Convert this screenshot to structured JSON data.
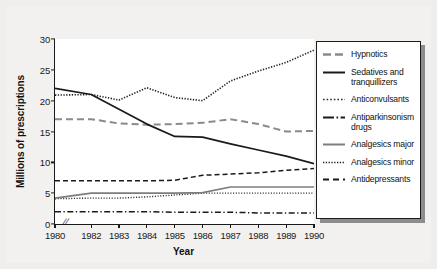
{
  "chart_data": {
    "type": "line",
    "title": "",
    "xlabel": "Year",
    "ylabel": "Millions of prescriptions",
    "x": [
      1980,
      1982,
      1983,
      1984,
      1985,
      1986,
      1987,
      1988,
      1989,
      1990
    ],
    "xticklabels": [
      "1980",
      "1982",
      "1983",
      "1984",
      "1985",
      "1986",
      "1987",
      "1988",
      "1989",
      "1990"
    ],
    "yticklabels": [
      "0",
      "5",
      "10",
      "15",
      "20",
      "25",
      "30"
    ],
    "ytickvalues": [
      0,
      5,
      10,
      15,
      20,
      25,
      30
    ],
    "xlim": [
      1980,
      1990
    ],
    "ylim": [
      0,
      30
    ],
    "grid": false,
    "axis_break": true,
    "axis_break_note": "//",
    "legend_position": "right-outside",
    "series": [
      {
        "name": "Hypnotics",
        "style": "long-dash",
        "color": "#8a8a8a",
        "values": [
          17.0,
          17.0,
          16.3,
          16.1,
          16.2,
          16.4,
          17.0,
          16.2,
          15.0,
          15.1
        ]
      },
      {
        "name": "Sedatives and tranquillizers",
        "style": "solid",
        "color": "#1a1a1a",
        "values": [
          22.0,
          21.0,
          18.6,
          16.2,
          14.2,
          14.1,
          13.0,
          12.0,
          11.0,
          9.8
        ]
      },
      {
        "name": "Anticonvulsants",
        "style": "fine-dotted",
        "color": "#2b2b2b",
        "values": [
          4.1,
          4.2,
          4.2,
          4.4,
          4.7,
          5.0,
          5.0,
          5.0,
          5.0,
          5.0
        ]
      },
      {
        "name": "Antiparkinsonism drugs",
        "style": "dash-dot",
        "color": "#1a1a1a",
        "values": [
          2.0,
          2.0,
          2.0,
          2.0,
          1.9,
          1.9,
          1.9,
          1.8,
          1.8,
          1.8
        ]
      },
      {
        "name": "Analgesics major",
        "style": "solid-gray",
        "color": "#7d7d7d",
        "values": [
          4.2,
          5.0,
          5.0,
          5.0,
          5.0,
          5.1,
          6.0,
          6.0,
          6.0,
          6.0
        ]
      },
      {
        "name": "Analgesics minor",
        "style": "dotted",
        "color": "#1f1f1f",
        "values": [
          20.9,
          21.0,
          20.1,
          22.1,
          20.5,
          20.0,
          23.2,
          24.8,
          26.2,
          28.2
        ]
      },
      {
        "name": "Antidepressants",
        "style": "dashed",
        "color": "#1a1a1a",
        "values": [
          7.0,
          7.0,
          7.0,
          7.0,
          7.1,
          7.9,
          8.1,
          8.3,
          8.7,
          9.0
        ]
      }
    ]
  },
  "legend": {
    "items": [
      {
        "label": "Hypnotics",
        "swatch": "long-dash-swatch"
      },
      {
        "label": "Sedatives and tranquillizers",
        "swatch": "solid-swatch"
      },
      {
        "label": "Anticonvulsants",
        "swatch": "fine-dotted-swatch"
      },
      {
        "label": "Antiparkinsonism drugs",
        "swatch": "dash-dot-swatch"
      },
      {
        "label": "Analgesics major",
        "swatch": "solid-gray-swatch"
      },
      {
        "label": "Analgesics minor",
        "swatch": "dotted-swatch"
      },
      {
        "label": "Antidepressants",
        "swatch": "dashed-swatch"
      }
    ]
  }
}
